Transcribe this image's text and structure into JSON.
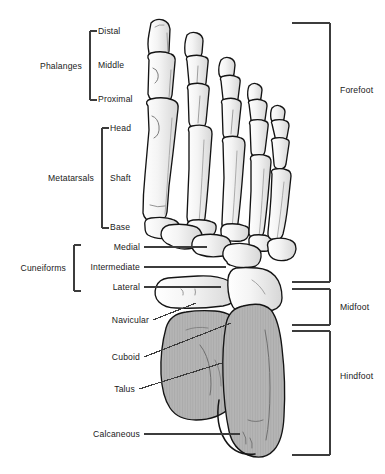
{
  "diagram": {
    "view": "dorsal / superior",
    "colors": {
      "outline": "#1a1a1a",
      "bone_light_fill": "#f2f2f2",
      "bone_shadow_fill": "#d9d9d9",
      "hindfoot_fill": "#b5b5b5",
      "bracket": "#3c3c3c",
      "leader_line": "#3c3c3c",
      "text": "#1a1a1a",
      "background": "#ffffff"
    }
  },
  "left_groups": [
    {
      "group_label": "Phalanges",
      "group_label_x": 82,
      "group_label_y": 66,
      "bracket": {
        "x": 90,
        "top": 31,
        "bottom": 100,
        "tick": 7
      },
      "items": [
        {
          "label": "Distal",
          "x": 98,
          "y": 31
        },
        {
          "label": "Middle",
          "x": 98,
          "y": 65
        },
        {
          "label": "Proximal",
          "x": 98,
          "y": 99
        }
      ]
    },
    {
      "group_label": "Metatarsals",
      "group_label_x": 94,
      "group_label_y": 178,
      "bracket": {
        "x": 102,
        "top": 128,
        "bottom": 228,
        "tick": 7
      },
      "items": [
        {
          "label": "Head",
          "x": 110,
          "y": 128
        },
        {
          "label": "Shaft",
          "x": 110,
          "y": 178
        },
        {
          "label": "Base",
          "x": 110,
          "y": 227
        }
      ]
    },
    {
      "group_label": "Cuneiforms",
      "group_label_x": 66,
      "group_label_y": 268,
      "bracket": {
        "x": 74,
        "top": 245,
        "bottom": 291,
        "tick": 7
      },
      "items": [
        {
          "label": "Medial",
          "x": 140,
          "y": 247,
          "leader": {
            "x1": 144,
            "y1": 247,
            "x2": 207,
            "y2": 247
          }
        },
        {
          "label": "Intermediate",
          "x": 140,
          "y": 267,
          "leader": {
            "x1": 144,
            "y1": 267,
            "x2": 226,
            "y2": 267
          }
        },
        {
          "label": "Lateral",
          "x": 140,
          "y": 287,
          "leader": {
            "x1": 144,
            "y1": 287,
            "x2": 221,
            "y2": 287
          }
        }
      ]
    }
  ],
  "left_callouts": [
    {
      "label": "Navicular",
      "x": 149,
      "y": 320,
      "leader": {
        "x1": 153,
        "y1": 320,
        "x2": 196,
        "y2": 303
      }
    },
    {
      "label": "Cuboid",
      "x": 140,
      "y": 357,
      "leader": {
        "x1": 144,
        "y1": 357,
        "x2": 231,
        "y2": 323
      }
    },
    {
      "label": "Talus",
      "x": 135,
      "y": 389,
      "leader": {
        "x1": 139,
        "y1": 389,
        "x2": 222,
        "y2": 363
      }
    },
    {
      "label": "Calcaneous",
      "x": 140,
      "y": 434,
      "leader": {
        "x1": 144,
        "y1": 434,
        "x2": 240,
        "y2": 434
      }
    }
  ],
  "right_brackets": [
    {
      "label": "Forefoot",
      "label_x": 340,
      "label_y": 90,
      "bracket": {
        "x": 330,
        "top": 23,
        "bottom": 282,
        "tick": 38
      }
    },
    {
      "label": "Midfoot",
      "label_x": 340,
      "label_y": 307,
      "bracket": {
        "x": 330,
        "top": 289,
        "bottom": 325,
        "tick": 38
      }
    },
    {
      "label": "Hindfoot",
      "label_x": 340,
      "label_y": 376,
      "bracket": {
        "x": 330,
        "top": 331,
        "bottom": 455,
        "tick": 38
      }
    }
  ]
}
